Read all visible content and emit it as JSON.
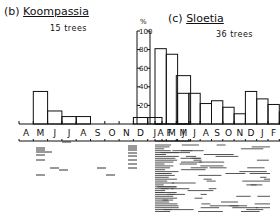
{
  "chart_data": [
    {
      "type": "bar",
      "panel": "(b)",
      "title": "Koompassia",
      "subtitle": "15 trees",
      "categories": [
        "A",
        "M",
        "J",
        "J",
        "A",
        "S",
        "O",
        "N",
        "D",
        "J",
        "F",
        "M"
      ],
      "values": [
        0,
        35,
        14,
        8,
        8,
        0,
        0,
        0,
        7,
        7,
        0,
        52
      ],
      "ylabel": "%",
      "ylim": [
        0,
        100
      ],
      "yticks": [
        20,
        40,
        60,
        80,
        100
      ]
    },
    {
      "type": "bar",
      "panel": "(c)",
      "title": "Sloetia",
      "subtitle": "36 trees",
      "categories": [
        "A",
        "M",
        "J",
        "J",
        "A",
        "S",
        "O",
        "N",
        "D",
        "J",
        "F",
        "M"
      ],
      "values": [
        81,
        75,
        33,
        33,
        22,
        25,
        18,
        11,
        35,
        27,
        21,
        13
      ],
      "ylabel": "%",
      "ylim": [
        0,
        100
      ],
      "yticks": [
        20,
        40,
        60,
        80,
        100
      ]
    }
  ],
  "left": {
    "panel": "(b)",
    "name": "Koompassia",
    "trees": "15 trees"
  },
  "right": {
    "panel": "(c)",
    "name": "Sloetia",
    "trees": "36 trees"
  },
  "axis": {
    "unit": "%",
    "ticks": [
      "100",
      "80",
      "60",
      "40",
      "20"
    ]
  },
  "months": [
    "A",
    "M",
    "J",
    "J",
    "A",
    "S",
    "O",
    "N",
    "D",
    "J",
    "F",
    "M"
  ]
}
